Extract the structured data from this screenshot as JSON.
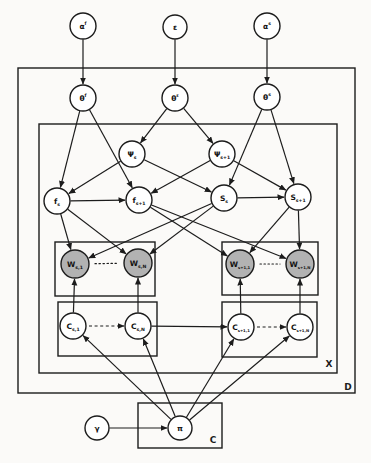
{
  "figure": {
    "width": 371,
    "height": 463,
    "background": "#fbfaf8",
    "stroke_color": "#1c1c1c",
    "node_fill": "#ffffff",
    "observed_node_fill": "#b2b2b2"
  },
  "plates": [
    {
      "id": "D",
      "x": 18,
      "y": 68,
      "w": 337,
      "h": 325,
      "label": "D",
      "label_x": 348,
      "label_y": 390
    },
    {
      "id": "X",
      "x": 39,
      "y": 124,
      "w": 298,
      "h": 249,
      "label": "X",
      "label_x": 329,
      "label_y": 367
    },
    {
      "id": "W-left",
      "x": 55,
      "y": 242,
      "w": 100,
      "h": 54,
      "label": ""
    },
    {
      "id": "W-right",
      "x": 222,
      "y": 242,
      "w": 96,
      "h": 53,
      "label": ""
    },
    {
      "id": "C-left",
      "x": 58,
      "y": 302,
      "w": 99,
      "h": 54,
      "label": ""
    },
    {
      "id": "C-right",
      "x": 222,
      "y": 302,
      "w": 95,
      "h": 55,
      "label": ""
    },
    {
      "id": "C",
      "x": 138,
      "y": 403,
      "w": 84,
      "h": 45,
      "label": "C",
      "label_x": 213,
      "label_y": 443
    }
  ],
  "nodes": [
    {
      "id": "alpha-f",
      "main": "α",
      "sup": "f",
      "x": 83,
      "y": 26,
      "r": 13,
      "observed": false
    },
    {
      "id": "epsilon",
      "main": "ε",
      "x": 175,
      "y": 27,
      "r": 12,
      "observed": false
    },
    {
      "id": "alpha-s",
      "main": "α",
      "sup": "s",
      "x": 267,
      "y": 26,
      "r": 13,
      "observed": false
    },
    {
      "id": "theta-f",
      "main": "θ",
      "sup": "f",
      "x": 83,
      "y": 98,
      "r": 13,
      "observed": false
    },
    {
      "id": "theta-e",
      "main": "θ",
      "sup": "ε",
      "x": 175,
      "y": 98,
      "r": 13,
      "observed": false
    },
    {
      "id": "theta-s",
      "main": "θ",
      "sup": "s",
      "x": 267,
      "y": 97,
      "r": 13,
      "observed": false
    },
    {
      "id": "psi-s",
      "main": "Ψ",
      "sub": "s",
      "x": 132,
      "y": 154,
      "r": 13,
      "observed": false
    },
    {
      "id": "psi-s1",
      "main": "Ψ",
      "sub": "s+1",
      "x": 222,
      "y": 154,
      "r": 13,
      "observed": false
    },
    {
      "id": "f-s",
      "main": "f",
      "sub": "s",
      "x": 57,
      "y": 201,
      "r": 13,
      "observed": false
    },
    {
      "id": "f-s1",
      "main": "f",
      "sub": "s+1",
      "x": 139,
      "y": 200,
      "r": 13,
      "observed": false
    },
    {
      "id": "S-s",
      "main": "S",
      "sub": "s",
      "x": 224,
      "y": 198,
      "r": 13,
      "observed": false
    },
    {
      "id": "S-s1",
      "main": "S",
      "sub": "s+1",
      "x": 298,
      "y": 197,
      "r": 13,
      "observed": false
    },
    {
      "id": "W-s-1",
      "main": "W",
      "sub": "s,1",
      "x": 75,
      "y": 264,
      "r": 14,
      "observed": true
    },
    {
      "id": "W-s-N",
      "main": "W",
      "sub": "s,N",
      "x": 138,
      "y": 263,
      "r": 14,
      "observed": true
    },
    {
      "id": "W-s1-1",
      "main": "W",
      "sub": "s+1,1",
      "x": 240,
      "y": 264,
      "r": 14,
      "observed": true
    },
    {
      "id": "W-s1-N",
      "main": "W",
      "sub": "s+1,N",
      "x": 300,
      "y": 264,
      "r": 14,
      "observed": true
    },
    {
      "id": "C-s-1",
      "main": "C",
      "sub": "s,1",
      "x": 73,
      "y": 326,
      "r": 13,
      "observed": false
    },
    {
      "id": "C-s-N",
      "main": "C",
      "sub": "s,N",
      "x": 138,
      "y": 326,
      "r": 13,
      "observed": false
    },
    {
      "id": "C-s1-1",
      "main": "C",
      "sub": "s+1,1",
      "x": 241,
      "y": 327,
      "r": 13,
      "observed": false
    },
    {
      "id": "C-s1-N",
      "main": "C",
      "sub": "s+1,N",
      "x": 300,
      "y": 327,
      "r": 13,
      "observed": false
    },
    {
      "id": "gamma",
      "main": "γ",
      "x": 97,
      "y": 428,
      "r": 12,
      "observed": false
    },
    {
      "id": "pi",
      "main": "π",
      "x": 180,
      "y": 428,
      "r": 12,
      "observed": false
    }
  ],
  "edges": [
    {
      "from": "alpha-f",
      "to": "theta-f",
      "style": "arrow"
    },
    {
      "from": "epsilon",
      "to": "theta-e",
      "style": "arrow"
    },
    {
      "from": "alpha-s",
      "to": "theta-s",
      "style": "arrow"
    },
    {
      "from": "theta-f",
      "to": "f-s",
      "style": "arrow"
    },
    {
      "from": "theta-f",
      "to": "f-s1",
      "style": "arrow"
    },
    {
      "from": "theta-e",
      "to": "psi-s",
      "style": "arrow"
    },
    {
      "from": "theta-e",
      "to": "psi-s1",
      "style": "arrow"
    },
    {
      "from": "theta-s",
      "to": "S-s",
      "style": "arrow"
    },
    {
      "from": "theta-s",
      "to": "S-s1",
      "style": "arrow"
    },
    {
      "from": "psi-s",
      "to": "f-s",
      "style": "arrow"
    },
    {
      "from": "psi-s",
      "to": "S-s",
      "style": "arrow"
    },
    {
      "from": "psi-s1",
      "to": "f-s1",
      "style": "arrow"
    },
    {
      "from": "psi-s1",
      "to": "S-s1",
      "style": "arrow"
    },
    {
      "from": "f-s",
      "to": "f-s1",
      "style": "arrow"
    },
    {
      "from": "S-s",
      "to": "S-s1",
      "style": "arrow"
    },
    {
      "from": "f-s",
      "to": "W-s-1",
      "style": "arrow"
    },
    {
      "from": "f-s",
      "to": "W-s-N",
      "style": "arrow"
    },
    {
      "from": "S-s",
      "to": "W-s-1",
      "style": "arrow"
    },
    {
      "from": "S-s",
      "to": "W-s-N",
      "style": "arrow"
    },
    {
      "from": "f-s1",
      "to": "W-s1-1",
      "style": "arrow"
    },
    {
      "from": "f-s1",
      "to": "W-s1-N",
      "style": "arrow"
    },
    {
      "from": "S-s1",
      "to": "W-s1-1",
      "style": "arrow"
    },
    {
      "from": "S-s1",
      "to": "W-s1-N",
      "style": "arrow"
    },
    {
      "from": "W-s-1",
      "to": "W-s-N",
      "style": "dotted"
    },
    {
      "from": "W-s1-1",
      "to": "W-s1-N",
      "style": "dotted"
    },
    {
      "from": "C-s-1",
      "to": "W-s-1",
      "style": "arrow"
    },
    {
      "from": "C-s-N",
      "to": "W-s-N",
      "style": "arrow"
    },
    {
      "from": "C-s1-1",
      "to": "W-s1-1",
      "style": "arrow"
    },
    {
      "from": "C-s1-N",
      "to": "W-s1-N",
      "style": "arrow"
    },
    {
      "from": "C-s-1",
      "to": "C-s-N",
      "style": "dashed-arrow"
    },
    {
      "from": "C-s-N",
      "to": "C-s1-1",
      "style": "arrow"
    },
    {
      "from": "C-s1-1",
      "to": "C-s1-N",
      "style": "dashed-arrow"
    },
    {
      "from": "gamma",
      "to": "pi",
      "style": "arrow"
    },
    {
      "from": "pi",
      "to": "C-s-1",
      "style": "arrow"
    },
    {
      "from": "pi",
      "to": "C-s-N",
      "style": "arrow"
    },
    {
      "from": "pi",
      "to": "C-s1-1",
      "style": "arrow"
    },
    {
      "from": "pi",
      "to": "C-s1-N",
      "style": "arrow"
    }
  ]
}
